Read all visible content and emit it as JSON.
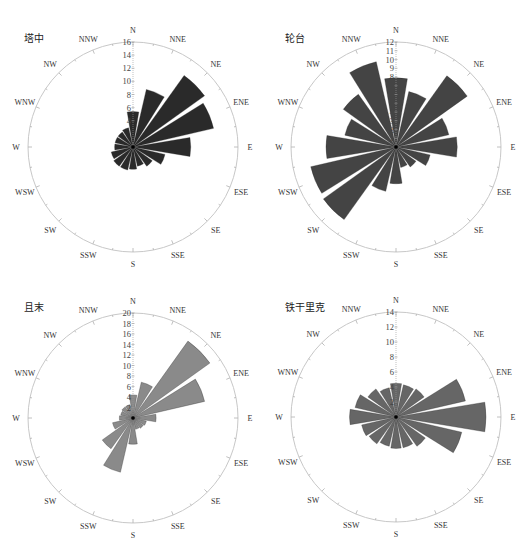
{
  "directions": [
    "N",
    "NNE",
    "NE",
    "ENE",
    "E",
    "ESE",
    "SE",
    "SSE",
    "S",
    "SSW",
    "SW",
    "WSW",
    "W",
    "WNW",
    "NW",
    "NNW"
  ],
  "chart_data": [
    {
      "type": "polar-bar",
      "title": "塔中",
      "rmax": 16,
      "ticks": [
        2,
        4,
        6,
        8,
        10,
        12,
        14,
        16
      ],
      "tick_labels_shown": [
        4,
        6,
        8,
        10,
        12,
        14,
        16
      ],
      "color": "#2a2a2a",
      "categories": [
        "N",
        "NNE",
        "NE",
        "ENE",
        "E",
        "ESE",
        "SE",
        "SSE",
        "S",
        "SSW",
        "SW",
        "WSW",
        "W",
        "WNW",
        "NW",
        "NNW"
      ],
      "values": [
        5.4,
        9.0,
        13.4,
        12.6,
        8.8,
        5.0,
        3.6,
        3.0,
        3.4,
        3.6,
        3.6,
        3.4,
        2.8,
        2.8,
        2.8,
        3.0
      ]
    },
    {
      "type": "polar-bar",
      "title": "轮台",
      "rmax": 12,
      "ticks": [
        1,
        2,
        3,
        4,
        5,
        6,
        7,
        8,
        9,
        10,
        11,
        12
      ],
      "tick_labels_shown": [
        1,
        2,
        3,
        4,
        5,
        6,
        7,
        8,
        9,
        10,
        11,
        12
      ],
      "color": "#444444",
      "categories": [
        "N",
        "NNE",
        "NE",
        "ENE",
        "E",
        "ESE",
        "SE",
        "SSE",
        "S",
        "SSW",
        "SW",
        "WSW",
        "W",
        "WNW",
        "NW",
        "NNW"
      ],
      "values": [
        7.9,
        6.5,
        10.0,
        6.2,
        7.0,
        4.0,
        2.8,
        2.4,
        4.2,
        5.2,
        10.2,
        10.0,
        8.0,
        6.0,
        7.4,
        10.0
      ]
    },
    {
      "type": "polar-bar",
      "title": "且末",
      "rmax": 20,
      "ticks": [
        2,
        4,
        6,
        8,
        10,
        12,
        14,
        16,
        18,
        20
      ],
      "tick_labels_shown": [
        2,
        4,
        6,
        8,
        10,
        12,
        14,
        16,
        18,
        20
      ],
      "color": "#8a8a8a",
      "categories": [
        "N",
        "NNE",
        "NE",
        "ENE",
        "E",
        "ESE",
        "SE",
        "SSE",
        "S",
        "SSW",
        "SW",
        "WSW",
        "W",
        "WNW",
        "NW",
        "NNW"
      ],
      "values": [
        4.4,
        7.0,
        18.0,
        14.0,
        4.4,
        2.6,
        2.4,
        2.2,
        5.0,
        10.6,
        7.2,
        4.0,
        2.6,
        2.4,
        2.6,
        2.6
      ]
    },
    {
      "type": "polar-bar",
      "title": "铁干里克",
      "rmax": 14,
      "ticks": [
        2,
        4,
        6,
        8,
        10,
        12,
        14
      ],
      "tick_labels_shown": [
        2,
        4,
        6,
        8,
        10,
        12,
        14
      ],
      "color": "#666666",
      "categories": [
        "N",
        "NNE",
        "NE",
        "ENE",
        "E",
        "ESE",
        "SE",
        "SSE",
        "S",
        "SSW",
        "SW",
        "WSW",
        "W",
        "WNW",
        "NW",
        "NNW"
      ],
      "values": [
        4.5,
        4.4,
        4.6,
        9.5,
        12.0,
        9.0,
        4.8,
        4.2,
        4.2,
        4.0,
        4.4,
        4.7,
        6.2,
        5.6,
        4.6,
        4.0
      ]
    }
  ]
}
